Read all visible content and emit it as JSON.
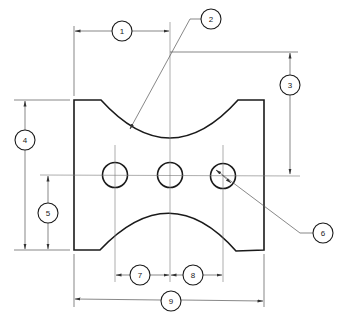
{
  "drawing": {
    "type": "dimensioned-part-drawing",
    "colors": {
      "outline": "#1a1a1a",
      "dimension": "#555555",
      "background": "#ffffff"
    },
    "part": {
      "shape": "rectangular plate with two concave arcs (top and bottom) and three holes",
      "holes": 3
    },
    "balloons": [
      {
        "id": "b1",
        "label": "1",
        "x": 122,
        "y": 31
      },
      {
        "id": "b2",
        "label": "2",
        "x": 211,
        "y": 19
      },
      {
        "id": "b3",
        "label": "3",
        "x": 290,
        "y": 85
      },
      {
        "id": "b4",
        "label": "4",
        "x": 25,
        "y": 140
      },
      {
        "id": "b5",
        "label": "5",
        "x": 48,
        "y": 213
      },
      {
        "id": "b6",
        "label": "6",
        "x": 323,
        "y": 233
      },
      {
        "id": "b7",
        "label": "7",
        "x": 140,
        "y": 275
      },
      {
        "id": "b8",
        "label": "8",
        "x": 193,
        "y": 275
      },
      {
        "id": "b9",
        "label": "9",
        "x": 171,
        "y": 301
      }
    ]
  }
}
